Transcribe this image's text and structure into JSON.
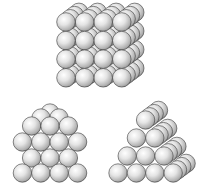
{
  "diagram": {
    "structures": [
      {
        "name": "cubic-block",
        "description": "Cubic stacking of spheres",
        "front_rows": 4,
        "front_cols": 4,
        "depth_layers": 4
      },
      {
        "name": "hexagonal-layers-front",
        "description": "Close-packed layered arrangement, front view",
        "rows": [
          3,
          4,
          3,
          4
        ]
      },
      {
        "name": "triangular-pyramid-stack",
        "description": "Triangular stack of spheres, oblique view",
        "rows": [
          1,
          2,
          3,
          4
        ],
        "depth_layers": 4
      }
    ],
    "colors": {
      "sphere_light": "#ffffff",
      "sphere_mid": "#d6d6d6",
      "sphere_dark": "#8a8a8a",
      "outline": "#3a3a3a"
    }
  }
}
